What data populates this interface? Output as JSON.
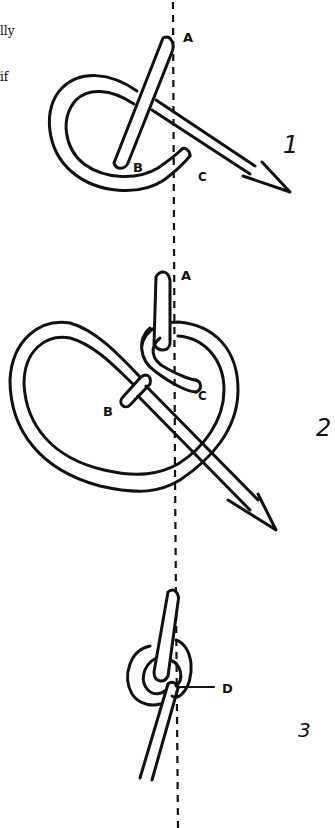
{
  "figure": {
    "type": "knot-tying instruction diagram",
    "clipped_text": [
      "lly",
      "if"
    ],
    "steps": [
      {
        "number": "1",
        "labels": [
          "A",
          "B",
          "C"
        ]
      },
      {
        "number": "2",
        "labels": [
          "A",
          "B",
          "C"
        ]
      },
      {
        "number": "3",
        "labels": [
          "D"
        ]
      }
    ],
    "guide_line": "vertical dashed line",
    "colors": {
      "ink": "#111111",
      "paper": "#ffffff"
    }
  }
}
